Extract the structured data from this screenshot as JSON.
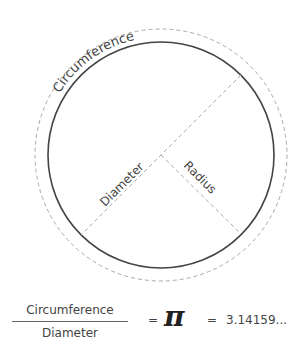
{
  "diagram": {
    "labels": {
      "circumference": "Circumference",
      "diameter": "Diameter",
      "radius": "Radius"
    },
    "colors": {
      "circle": "#444444",
      "dashed": "#aaaaaa",
      "text": "#444444"
    }
  },
  "formula": {
    "numerator": "Circumference",
    "denominator": "Diameter",
    "equals": "=",
    "symbol": "π",
    "equals2": "=",
    "value": "3.14159..."
  }
}
